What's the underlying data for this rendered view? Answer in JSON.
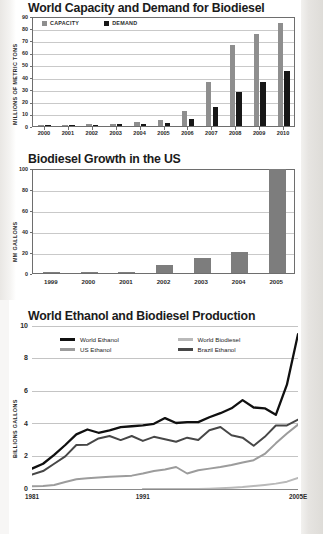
{
  "page": {
    "background": "#ffffff",
    "scan_edge_color": "#e3e1de"
  },
  "charts": [
    {
      "id": "chart-capacity-demand",
      "title": "World Capacity and Demand for Biodiesel"
    },
    {
      "id": "chart-us-growth",
      "title": "Biodiesel Growth in the US"
    },
    {
      "id": "chart-world-production",
      "title": "World Ethanol and Biodiesel Production"
    }
  ],
  "chart_data": [
    {
      "type": "bar",
      "title": "World Capacity and Demand for Biodiesel",
      "xlabel": "",
      "ylabel": "MILLIONS OF METRIC TONS",
      "ylim": [
        0,
        90
      ],
      "yticks": [
        0,
        10,
        20,
        30,
        40,
        50,
        60,
        70,
        80,
        90
      ],
      "grid": true,
      "legend_position": "top-left",
      "categories": [
        "2000",
        "2001",
        "2002",
        "2003",
        "2004",
        "2005",
        "2006",
        "2007",
        "2008",
        "2009",
        "2010"
      ],
      "series": [
        {
          "name": "CAPACITY",
          "color": "#8e8e8e",
          "values": [
            0.8,
            1.2,
            1.5,
            2.0,
            3.0,
            5.0,
            12.0,
            36.0,
            66.0,
            75.0,
            84.0
          ]
        },
        {
          "name": "DEMAND",
          "color": "#171717",
          "values": [
            0.6,
            0.8,
            1.0,
            1.3,
            1.4,
            2.5,
            6.0,
            15.5,
            27.5,
            36.0,
            45.0
          ]
        }
      ]
    },
    {
      "type": "bar",
      "title": "Biodiesel Growth in the US",
      "xlabel": "",
      "ylabel": "MM GALLONS",
      "ylim": [
        0,
        100
      ],
      "yticks": [
        0,
        20,
        40,
        60,
        80,
        100
      ],
      "grid": true,
      "categories": [
        "1999",
        "2000",
        "2001",
        "2002",
        "2003",
        "2004",
        "2005"
      ],
      "values": [
        0.5,
        1.0,
        1.0,
        8.0,
        14.0,
        20.0,
        99.0
      ],
      "series": [
        {
          "name": "US Biodiesel Production",
          "color": "#7d7d7d",
          "values": [
            0.5,
            1.0,
            1.0,
            8.0,
            14.0,
            20.0,
            99.0
          ]
        }
      ]
    },
    {
      "type": "line",
      "title": "World Ethanol and Biodiesel Production",
      "xlabel": "",
      "ylabel": "BILLIONS GALLONS",
      "ylim": [
        0,
        10
      ],
      "yticks": [
        0,
        2,
        4,
        6,
        8,
        10
      ],
      "grid": true,
      "legend_position": "top-inside",
      "xticks_shown": [
        "1981",
        "1991",
        "2005E"
      ],
      "x": [
        "1981",
        "1982",
        "1983",
        "1984",
        "1985",
        "1986",
        "1987",
        "1988",
        "1989",
        "1990",
        "1991",
        "1992",
        "1993",
        "1994",
        "1995",
        "1996",
        "1997",
        "1998",
        "1999",
        "2000",
        "2001",
        "2002",
        "2003",
        "2004",
        "2005E"
      ],
      "series": [
        {
          "name": "World Ethanol",
          "color": "#101010",
          "values": [
            1.25,
            1.55,
            2.1,
            2.7,
            3.35,
            3.65,
            3.45,
            3.6,
            3.8,
            3.85,
            3.9,
            4.0,
            4.35,
            4.05,
            4.1,
            4.1,
            4.4,
            4.65,
            4.95,
            5.45,
            5.0,
            4.95,
            4.55,
            6.4,
            9.5
          ]
        },
        {
          "name": "World Biodiesel",
          "color": "#b9b9b9",
          "values": [
            null,
            null,
            null,
            null,
            null,
            null,
            null,
            null,
            null,
            null,
            0.0,
            0.0,
            0.0,
            0.0,
            0.0,
            0.0,
            0.02,
            0.05,
            0.08,
            0.12,
            0.18,
            0.25,
            0.33,
            0.45,
            0.68
          ]
        },
        {
          "name": "US Ethanol",
          "color": "#9c9c9c",
          "values": [
            0.17,
            0.18,
            0.25,
            0.43,
            0.6,
            0.66,
            0.71,
            0.75,
            0.78,
            0.82,
            0.95,
            1.1,
            1.2,
            1.35,
            0.95,
            1.15,
            1.25,
            1.35,
            1.47,
            1.63,
            1.77,
            2.15,
            2.8,
            3.4,
            3.95
          ]
        },
        {
          "name": "Brazil Ethanol",
          "color": "#474747",
          "values": [
            0.88,
            1.1,
            1.55,
            2.0,
            2.7,
            2.72,
            3.1,
            3.25,
            3.0,
            3.25,
            2.95,
            3.2,
            3.05,
            2.9,
            3.15,
            3.0,
            3.6,
            3.8,
            3.3,
            3.15,
            2.65,
            3.2,
            3.9,
            3.9,
            4.25
          ]
        }
      ]
    }
  ]
}
